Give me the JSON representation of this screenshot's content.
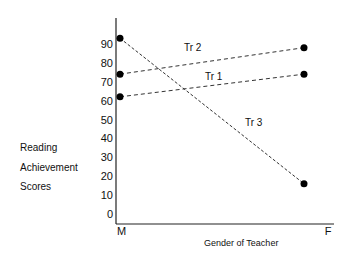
{
  "chart_data": {
    "type": "line",
    "title": "",
    "categories": [
      "M",
      "F"
    ],
    "xlabel": "Gender of Teacher",
    "ylabel_lines": [
      "Reading",
      "Achievement",
      "Scores"
    ],
    "yticks": [
      0,
      10,
      20,
      30,
      40,
      50,
      60,
      70,
      80,
      90
    ],
    "ylim": [
      0,
      100
    ],
    "grid": false,
    "series": [
      {
        "name": "Tr 1",
        "values": [
          62,
          74
        ]
      },
      {
        "name": "Tr 2",
        "values": [
          74,
          88
        ]
      },
      {
        "name": "Tr 3",
        "values": [
          93,
          16
        ]
      }
    ]
  }
}
